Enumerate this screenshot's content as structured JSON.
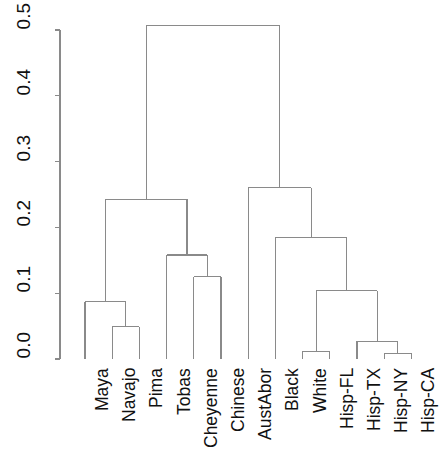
{
  "chart_data": {
    "type": "dendrogram",
    "title": "",
    "xlabel": "",
    "ylabel": "",
    "ylim": [
      0.0,
      0.53
    ],
    "grid": false,
    "legend": null,
    "line_color": "#8a8a8a",
    "axis_color": "#8a8a8a",
    "y_ticks": [
      "0.0",
      "0.1",
      "0.2",
      "0.3",
      "0.4",
      "0.5"
    ],
    "y_tick_values": [
      0.0,
      0.1,
      0.2,
      0.3,
      0.4,
      0.5
    ],
    "leaves": [
      "Maya",
      "Navajo",
      "Pima",
      "Tobas",
      "Cheyenne",
      "Chinese",
      "AustAbor",
      "Black",
      "White",
      "Hisp-FL",
      "Hisp-TX",
      "Hisp-NY",
      "Hisp-CA"
    ],
    "leaf_order": [
      1,
      2,
      3,
      4,
      5,
      6,
      7,
      8,
      9,
      10,
      11,
      12,
      13
    ],
    "merges": [
      {
        "id": "m1",
        "label": "Navajo + Pima",
        "left": "Navajo",
        "right": "Pima",
        "height": 0.049
      },
      {
        "id": "m2",
        "label": "Maya + (Navajo,Pima)",
        "left": "Maya",
        "right": "m1",
        "height": 0.087
      },
      {
        "id": "m3",
        "label": "Cheyenne + Chinese",
        "left": "Cheyenne",
        "right": "Chinese",
        "height": 0.125
      },
      {
        "id": "m4",
        "label": "Tobas + (Cheyenne,Chinese)",
        "left": "Tobas",
        "right": "m3",
        "height": 0.158
      },
      {
        "id": "m5",
        "label": "Amerindian cluster",
        "left": "m2",
        "right": "m4",
        "height": 0.243
      },
      {
        "id": "m6",
        "label": "White + Hisp-FL",
        "left": "White",
        "right": "Hisp-FL",
        "height": 0.012
      },
      {
        "id": "m7",
        "label": "Hisp-NY + Hisp-CA",
        "left": "Hisp-NY",
        "right": "Hisp-CA",
        "height": 0.009
      },
      {
        "id": "m8",
        "label": "Hisp-TX + (Hisp-NY,Hisp-CA)",
        "left": "Hisp-TX",
        "right": "m7",
        "height": 0.027
      },
      {
        "id": "m9",
        "label": "(White,Hisp-FL) + Hisp admix",
        "left": "m6",
        "right": "m8",
        "height": 0.104
      },
      {
        "id": "m10",
        "label": "Black + admixed cluster",
        "left": "Black",
        "right": "m9",
        "height": 0.184
      },
      {
        "id": "m11",
        "label": "AustAbor + (Black,admixed)",
        "left": "AustAbor",
        "right": "m10",
        "height": 0.26
      },
      {
        "id": "m12",
        "label": "Root",
        "left": "m5",
        "right": "m11",
        "height": 0.507
      }
    ]
  }
}
